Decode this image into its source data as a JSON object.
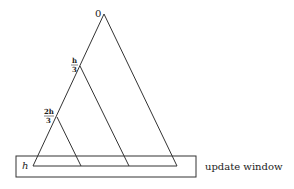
{
  "diagram": {
    "apex_label": "0",
    "level1_label": {
      "num": "h",
      "den": "3"
    },
    "level2_label": {
      "num": "2h",
      "den": "3"
    },
    "base_label": "h",
    "window_label": "update window",
    "stroke_color": "#333333"
  }
}
